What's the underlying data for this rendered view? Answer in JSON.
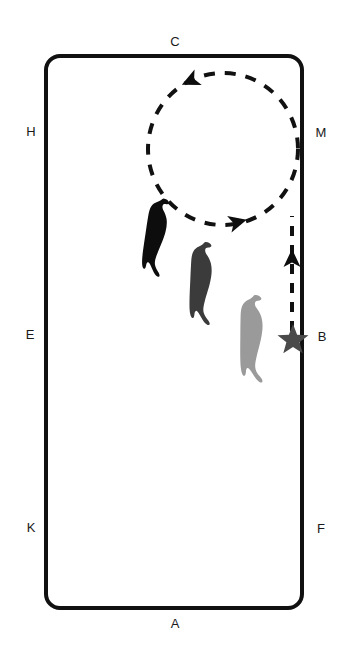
{
  "diagram": {
    "type": "dressage-arena-movement-diagram",
    "arena": {
      "shape": "rounded-rectangle",
      "stroke_color": "#111111",
      "fill_color": "#ffffff",
      "stroke_width_px": 4,
      "corner_radius_px": 14,
      "left_px": 46,
      "top_px": 56,
      "right_px": 302,
      "bottom_px": 608
    },
    "markers": [
      {
        "id": "marker-c",
        "label": "C",
        "x": 175,
        "y": 41,
        "side": "top"
      },
      {
        "id": "marker-h",
        "label": "H",
        "x": 31,
        "y": 131,
        "side": "left"
      },
      {
        "id": "marker-m",
        "label": "M",
        "x": 321,
        "y": 132,
        "side": "right"
      },
      {
        "id": "marker-e",
        "label": "E",
        "x": 30,
        "y": 334,
        "side": "left"
      },
      {
        "id": "marker-b",
        "label": "B",
        "x": 322,
        "y": 336,
        "side": "right"
      },
      {
        "id": "marker-k",
        "label": "K",
        "x": 31,
        "y": 527,
        "side": "left"
      },
      {
        "id": "marker-f",
        "label": "F",
        "x": 321,
        "y": 528,
        "side": "right"
      },
      {
        "id": "marker-a",
        "label": "A",
        "x": 175,
        "y": 623,
        "side": "bottom"
      }
    ],
    "start_point": {
      "name": "start-star",
      "shape": "five-pointed-star",
      "color": "#4a4a4a",
      "x": 293,
      "y": 337,
      "size_px": 27,
      "at_marker": "B"
    },
    "path": {
      "name": "movement-path",
      "style": "dashed",
      "color": "#111111",
      "stroke_width_px": 4,
      "dash_pattern": "10 9",
      "segments": [
        {
          "id": "approach-line",
          "kind": "straight",
          "from_x": 292,
          "from_y": 330,
          "to_x": 292,
          "to_y": 218,
          "direction": "upward"
        },
        {
          "id": "volte-circle",
          "kind": "circle",
          "center_x": 223,
          "center_y": 149,
          "radius_x": 75,
          "radius_y": 76,
          "direction": "counter-clockwise"
        }
      ],
      "arrowheads": [
        {
          "id": "arrow-up-line",
          "x": 292,
          "y": 258,
          "points": "up"
        },
        {
          "id": "arrow-circle-top",
          "x": 190,
          "y": 80,
          "points": "left"
        },
        {
          "id": "arrow-circle-bottom",
          "x": 238,
          "y": 221,
          "points": "right"
        }
      ]
    },
    "figures": [
      {
        "id": "rider-figure-1",
        "label": "rider-silhouette-dark",
        "color": "#0d0d0d",
        "x": 155,
        "y": 230,
        "width": 26,
        "height": 66,
        "rotation_deg": 12
      },
      {
        "id": "rider-figure-2",
        "label": "rider-silhouette-medium",
        "color": "#3b3b3b",
        "x": 201,
        "y": 280,
        "width": 27,
        "height": 77,
        "rotation_deg": 6
      },
      {
        "id": "rider-figure-3",
        "label": "rider-silhouette-light",
        "color": "#9a9a9a",
        "x": 251,
        "y": 337,
        "width": 27,
        "height": 84,
        "rotation_deg": 4
      }
    ]
  }
}
